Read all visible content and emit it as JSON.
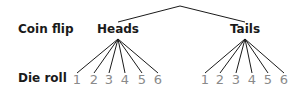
{
  "diagram": {
    "type": "tree",
    "row_labels": {
      "coin_flip": "Coin flip",
      "die_roll": "Die roll"
    },
    "root": {
      "x": 180,
      "y": 6
    },
    "branches": [
      {
        "label": "Heads",
        "x": 118,
        "outcomes": [
          "1",
          "2",
          "3",
          "4",
          "5",
          "6"
        ],
        "outcome_x": [
          77,
          94,
          109,
          125,
          142,
          158
        ]
      },
      {
        "label": "Tails",
        "x": 245,
        "outcomes": [
          "1",
          "2",
          "3",
          "4",
          "5",
          "6"
        ],
        "outcome_x": [
          205,
          220,
          236,
          252,
          268,
          284
        ]
      }
    ],
    "colors": {
      "line": "#1a1a1a",
      "node_text": "#1a1a1a",
      "outcome_text": "#8a8a8a"
    }
  }
}
